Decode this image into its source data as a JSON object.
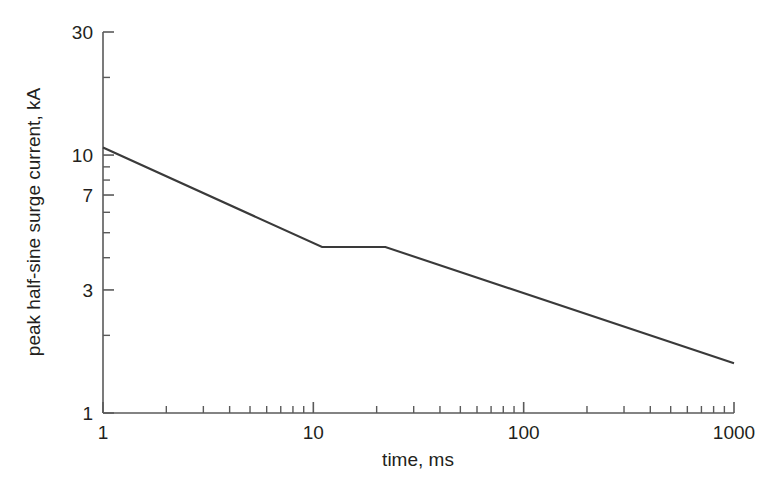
{
  "figure": {
    "background_color": "#ffffff",
    "line_color": "#3a3a3a",
    "axis_color": "#5a5a5a",
    "text_color": "#231f20"
  },
  "chart_data": {
    "type": "line",
    "title": "",
    "xlabel": "time, ms",
    "ylabel": "peak half-sine surge current, kA",
    "xscale": "log",
    "yscale": "log",
    "xlim": [
      1,
      1000
    ],
    "ylim": [
      1,
      30
    ],
    "grid": false,
    "legend": null,
    "x_tick_labels": [
      "1",
      "10",
      "100",
      "1000"
    ],
    "x_tick_values": [
      1,
      10,
      100,
      1000
    ],
    "y_tick_labels": [
      "1",
      "3",
      "7",
      "10",
      "30"
    ],
    "y_tick_values": [
      1,
      3,
      7,
      10,
      30
    ],
    "x_minor_ticks": [
      2,
      3,
      4,
      5,
      6,
      7,
      8,
      9,
      20,
      30,
      40,
      50,
      60,
      70,
      80,
      90,
      200,
      300,
      400,
      500,
      600,
      700,
      800,
      900
    ],
    "y_minor_ticks": [
      2,
      4,
      5,
      6,
      8,
      9,
      20
    ],
    "series": [
      {
        "name": "peak half-sine surge current",
        "x": [
          1,
          11,
          22,
          1000
        ],
        "y": [
          10.7,
          4.4,
          4.4,
          1.56
        ]
      }
    ]
  }
}
